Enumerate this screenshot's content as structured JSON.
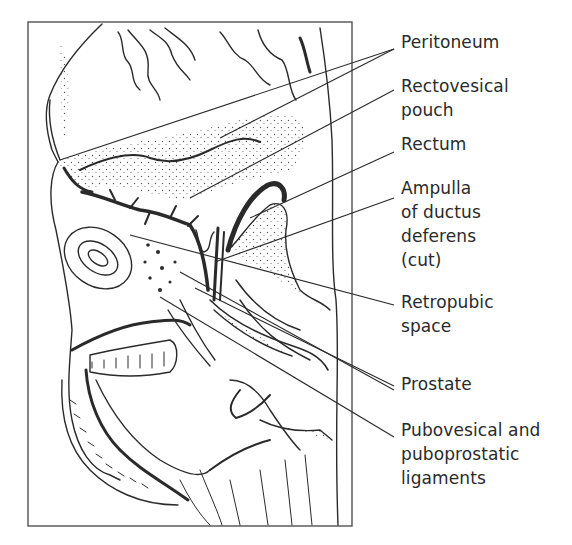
{
  "figure": {
    "type": "anatomical line drawing",
    "ink_color": "#2a2a2a",
    "background": "#ffffff"
  },
  "labels": [
    {
      "id": "peritoneum",
      "text": "Peritoneum",
      "top": 30
    },
    {
      "id": "rectovesical-pouch",
      "text": "Rectovesical\npouch",
      "top": 74
    },
    {
      "id": "rectum",
      "text": "Rectum",
      "top": 132
    },
    {
      "id": "ampulla",
      "text": "Ampulla\nof ductus\ndeferens\n(cut)",
      "top": 176
    },
    {
      "id": "retropubic-space",
      "text": "Retropubic\nspace",
      "top": 290
    },
    {
      "id": "prostate",
      "text": "Prostate",
      "top": 372
    },
    {
      "id": "ligaments",
      "text": "Pubovesical and\npuboprostatic\nligaments",
      "top": 418
    }
  ]
}
